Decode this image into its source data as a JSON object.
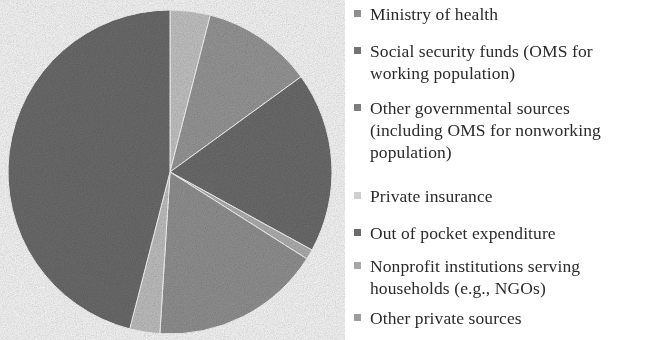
{
  "chart_data": {
    "type": "pie",
    "title": "",
    "subtitle": "",
    "xlabel": "",
    "ylabel": "",
    "legend_position": "right",
    "grid": false,
    "start_angle_deg": 0,
    "direction": "clockwise",
    "categories": [
      "Ministry of health",
      "Social security funds (OMS for working population)",
      "Other governmental sources (including OMS for nonworking population)",
      "Private insurance",
      "Out of pocket expenditure",
      "Nonprofit institutions serving households (e.g., NGOs)",
      "Other private sources"
    ],
    "values": [
      4,
      11,
      18,
      1,
      17,
      3,
      46
    ],
    "colors": [
      "#c9c9c9",
      "#9b9b9b",
      "#6f6f6f",
      "#b4b4b4",
      "#959595",
      "#c5c5c5",
      "#6e6e6e"
    ],
    "slices": [
      {
        "label": "Ministry of health",
        "value": 4,
        "color": "#c9c9c9",
        "start_deg": 0,
        "end_deg": 14.4
      },
      {
        "label": "Social security funds (OMS for working population)",
        "value": 11,
        "color": "#9b9b9b",
        "start_deg": 14.4,
        "end_deg": 54.0
      },
      {
        "label": "Other governmental sources (including OMS for nonworking population)",
        "value": 18,
        "color": "#6f6f6f",
        "start_deg": 54.0,
        "end_deg": 118.8
      },
      {
        "label": "Private insurance",
        "value": 1,
        "color": "#b4b4b4",
        "start_deg": 118.8,
        "end_deg": 122.4
      },
      {
        "label": "Out of pocket expenditure",
        "value": 17,
        "color": "#959595",
        "start_deg": 122.4,
        "end_deg": 183.6
      },
      {
        "label": "Nonprofit institutions serving households (e.g., NGOs)",
        "value": 3,
        "color": "#c5c5c5",
        "start_deg": 183.6,
        "end_deg": 194.4
      },
      {
        "label": "Other private sources",
        "value": 46,
        "color": "#6e6e6e",
        "start_deg": 194.4,
        "end_deg": 360
      }
    ],
    "geometry": {
      "cx": 170,
      "cy": 172,
      "r": 162
    }
  },
  "legend": {
    "items": [
      {
        "label": "Ministry of health",
        "color": "#8f8f8f",
        "name": "ministry-of-health"
      },
      {
        "label": "Social security funds (OMS for\nworking population)",
        "color": "#737373",
        "name": "social-security-funds"
      },
      {
        "label": "Other governmental sources\n(including OMS for nonworking\npopulation)",
        "color": "#7d7d7d",
        "name": "other-governmental-sources"
      },
      {
        "label": "Private insurance",
        "color": "#cfcfcf",
        "name": "private-insurance"
      },
      {
        "label": "Out of pocket expenditure",
        "color": "#6a6a6a",
        "name": "out-of-pocket-expenditure"
      },
      {
        "label": "Nonprofit institutions serving\nhouseholds (e.g., NGOs)",
        "color": "#a6a6a6",
        "name": "nonprofit-institutions"
      },
      {
        "label": "Other private sources",
        "color": "#9d9d9d",
        "name": "other-private-sources"
      }
    ]
  }
}
